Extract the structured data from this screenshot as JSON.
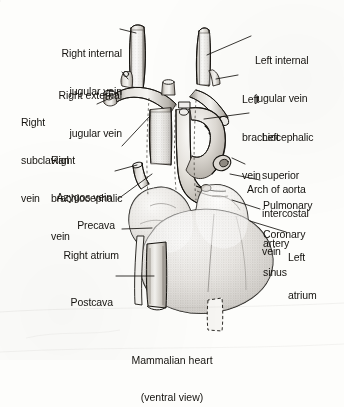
{
  "figure": {
    "title": "Mammalian heart",
    "subtitle": "(ventral view)",
    "view": "ventral",
    "subject": "Mammalian heart",
    "style": "stippled ink anatomical line drawing, grayscale"
  },
  "labels_left": [
    {
      "id": "right-internal-jugular-vein",
      "lines": [
        "Right internal",
        "jugular vein"
      ],
      "align": "right"
    },
    {
      "id": "right-external-jugular-vein",
      "lines": [
        "Right external",
        "jugular vein"
      ],
      "align": "right"
    },
    {
      "id": "right-subclavian-vein",
      "lines": [
        "Right",
        "subclavian",
        "vein"
      ],
      "align": "left"
    },
    {
      "id": "right-brachiocephalic-vein",
      "lines": [
        "Right",
        "brachiocephalic",
        "vein"
      ],
      "align": "left"
    },
    {
      "id": "azygos-vein",
      "lines": [
        "Azygos vein"
      ],
      "align": "right"
    },
    {
      "id": "precava",
      "lines": [
        "Precava"
      ],
      "align": "right"
    },
    {
      "id": "right-atrium",
      "lines": [
        "Right atrium"
      ],
      "align": "right"
    },
    {
      "id": "postcava",
      "lines": [
        "Postcava"
      ],
      "align": "right"
    }
  ],
  "labels_right": [
    {
      "id": "left-internal-jugular-vein",
      "lines": [
        "Left internal",
        "jugular vein"
      ],
      "align": "left"
    },
    {
      "id": "left-brachiocephalic-vein",
      "lines": [
        "Left",
        "brachiocephalic",
        "vein"
      ],
      "align": "left"
    },
    {
      "id": "left-superior-intercostal-vein",
      "lines": [
        "Left",
        "superior",
        "intercostal",
        "vein"
      ],
      "align": "left"
    },
    {
      "id": "arch-of-aorta",
      "lines": [
        "Arch of aorta"
      ],
      "align": "left"
    },
    {
      "id": "pulmonary-artery",
      "lines": [
        "Pulmonary",
        "artery"
      ],
      "align": "left"
    },
    {
      "id": "coronary-sinus",
      "lines": [
        "Coronary",
        "sinus"
      ],
      "align": "left"
    },
    {
      "id": "left-atrium",
      "lines": [
        "Left",
        "atrium"
      ],
      "align": "left"
    }
  ],
  "text": {
    "right_internal_jugular_vein_l1": "Right internal",
    "right_internal_jugular_vein_l2": "jugular vein",
    "right_external_jugular_vein_l1": "Right external",
    "right_external_jugular_vein_l2": "jugular vein",
    "right_subclavian_vein_l1": "Right",
    "right_subclavian_vein_l2": "subclavian",
    "right_subclavian_vein_l3": "vein",
    "right_brachiocephalic_vein_l1": "Right",
    "right_brachiocephalic_vein_l2": "brachiocephalic",
    "right_brachiocephalic_vein_l3": "vein",
    "azygos_vein": "Azygos vein",
    "precava": "Precava",
    "right_atrium": "Right atrium",
    "postcava": "Postcava",
    "left_internal_jugular_vein_l1": "Left internal",
    "left_internal_jugular_vein_l2": "jugular vein",
    "left_brachiocephalic_vein_l1": "Left",
    "left_brachiocephalic_vein_l2": "brachiocephalic",
    "left_brachiocephalic_vein_l3": "vein",
    "left_superior_intercostal_vein_l1": "Left",
    "left_superior_intercostal_vein_l2": "superior",
    "left_superior_intercostal_vein_l3": "intercostal",
    "left_superior_intercostal_vein_l4": "vein",
    "arch_of_aorta": "Arch of aorta",
    "pulmonary_artery_l1": "Pulmonary",
    "pulmonary_artery_l2": "artery",
    "coronary_sinus_l1": "Coronary",
    "coronary_sinus_l2": "sinus",
    "left_atrium_l1": "Left",
    "left_atrium_l2": "atrium",
    "caption_l1": "Mammalian heart",
    "caption_l2": "(ventral view)"
  },
  "colors": {
    "background": "#fdfdfb",
    "ink": "#15130f",
    "line": "#2b2722",
    "shade_light": "#e9e7e2",
    "shade_mid": "#c8c4bd",
    "shade_dark": "#8f8a82"
  }
}
